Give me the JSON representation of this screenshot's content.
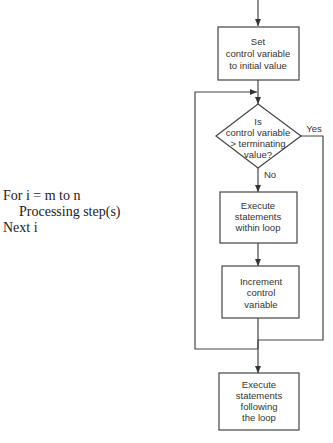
{
  "pseudocode": {
    "line1": "For i = m to n",
    "line2": "Processing step(s)",
    "line3": "Next i"
  },
  "flowchart": {
    "init_box": {
      "lines": [
        "Set",
        "control variable",
        "to initial value"
      ]
    },
    "decision": {
      "lines": [
        "Is",
        "control variable",
        "> terminating",
        "value?"
      ],
      "yes_label": "Yes",
      "no_label": "No"
    },
    "body_box": {
      "lines": [
        "Execute",
        "statements",
        "within loop"
      ]
    },
    "increment_box": {
      "lines": [
        "Increment",
        "control",
        "variable"
      ]
    },
    "exit_box": {
      "lines": [
        "Execute",
        "statements",
        "following",
        "the loop"
      ]
    }
  },
  "colors": {
    "line": "#444444",
    "text": "#333333",
    "background": "#ffffff"
  }
}
